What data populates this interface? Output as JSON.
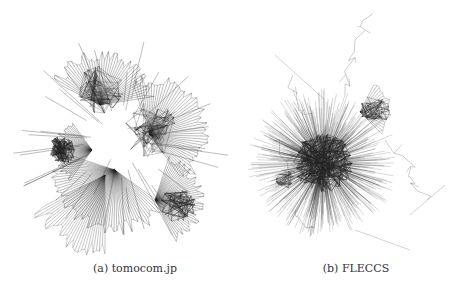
{
  "figure": {
    "panels": [
      {
        "label": "(a)",
        "name": "tomocom.jp",
        "caption": "(a) tomocom.jp",
        "description": "network graph with several fan-shaped clusters"
      },
      {
        "label": "(b)",
        "name": "FLECCS",
        "caption": "(b) FLECCS",
        "description": "network graph with one dense central cluster and sparse chains"
      }
    ],
    "colors": {
      "edge": "#222222",
      "background": "#ffffff"
    }
  }
}
